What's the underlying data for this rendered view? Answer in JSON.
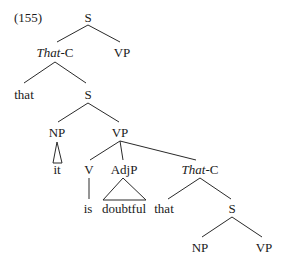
{
  "example_number": "(155)",
  "tree": {
    "root": "S",
    "root_children": {
      "thatc": "That",
      "thatc_suffix": "-C",
      "vp": "VP"
    },
    "level2": {
      "that": "that",
      "s": "S"
    },
    "level3": {
      "np": "NP",
      "vp": "VP"
    },
    "level4": {
      "it": "it",
      "v": "V",
      "adjp": "AdjP",
      "thatc": "That",
      "thatc_suffix": "-C"
    },
    "level5": {
      "is": "is",
      "doubtful": "doubtful",
      "that": "that",
      "s": "S"
    },
    "level6": {
      "np": "NP",
      "vp": "VP"
    }
  }
}
